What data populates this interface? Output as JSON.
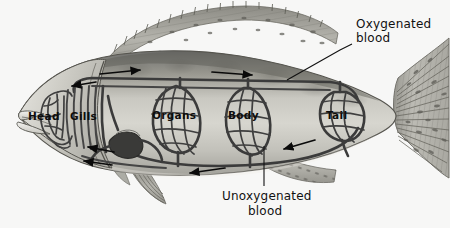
{
  "figure": {
    "background_color": "#f7f7f6",
    "ink_color": "#111111"
  },
  "organ_labels": [
    {
      "id": "head",
      "text": "Head",
      "x": 42,
      "y": 117
    },
    {
      "id": "gills",
      "text": "Gills",
      "x": 83,
      "y": 117
    },
    {
      "id": "organs",
      "text": "Organs",
      "x": 170,
      "y": 115
    },
    {
      "id": "body",
      "text": "Body",
      "x": 240,
      "y": 115
    },
    {
      "id": "tail",
      "text": "Tail",
      "x": 334,
      "y": 115
    }
  ],
  "callouts": [
    {
      "id": "oxygenated",
      "line1": "Oxygenated",
      "line2": "blood",
      "text_x": 364,
      "text_y": 30
    },
    {
      "id": "unoxygenated",
      "line1": "Unoxygenated",
      "line2": "blood",
      "text_x": 226,
      "text_y": 202
    }
  ],
  "flow_arrows": [
    {
      "id": "dorsal-arrow-1",
      "direction": "right",
      "x": 115,
      "y": 72
    },
    {
      "id": "dorsal-arrow-2",
      "direction": "right",
      "x": 225,
      "y": 73
    },
    {
      "id": "gill-arrow-up",
      "direction": "left",
      "x": 78,
      "y": 83
    },
    {
      "id": "ventral-arrow-1",
      "direction": "left",
      "x": 96,
      "y": 150
    },
    {
      "id": "ventral-arrow-2",
      "direction": "left",
      "x": 95,
      "y": 163
    },
    {
      "id": "ventral-arrow-3",
      "direction": "left",
      "x": 205,
      "y": 171
    },
    {
      "id": "tail-arrow",
      "direction": "left",
      "x": 295,
      "y": 145
    }
  ],
  "anatomy_parts": [
    "body-outline",
    "dorsal-fin",
    "caudal-fin",
    "pectoral-fin",
    "pelvic-fin",
    "anal-fin",
    "mouth",
    "heart",
    "dorsal-aorta",
    "ventral-aorta",
    "gill-filaments",
    "head-capillary-bed",
    "organs-capillary-bed",
    "body-capillary-bed",
    "tail-capillary-bed"
  ]
}
